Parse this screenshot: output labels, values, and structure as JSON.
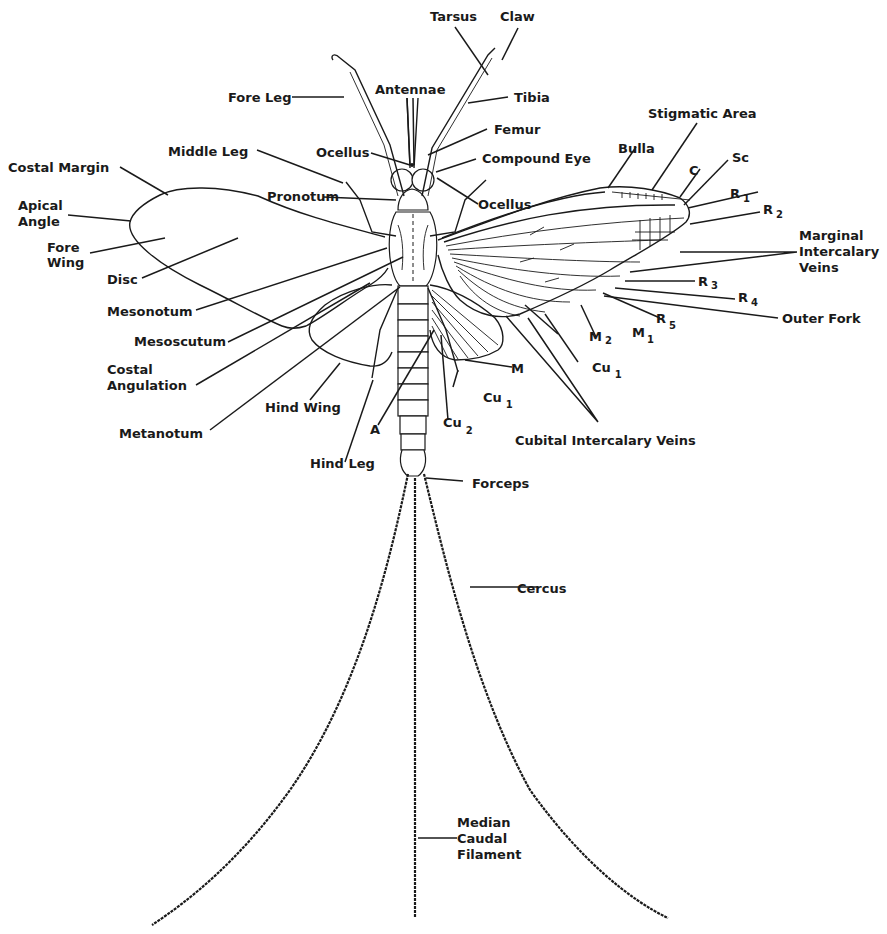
{
  "diagram": {
    "colors": {
      "ink": "#1a1a1a",
      "background": "#ffffff"
    },
    "labels": {
      "tarsus": "Tarsus",
      "claw": "Claw",
      "fore_leg": "Fore Leg",
      "antennae": "Antennae",
      "tibia": "Tibia",
      "stigmatic_area": "Stigmatic Area",
      "femur": "Femur",
      "middle_leg": "Middle Leg",
      "ocellus_left": "Ocellus",
      "compound_eye": "Compound Eye",
      "bulla": "Bulla",
      "c": "C",
      "sc": "Sc",
      "r1": "R",
      "r1_sub": "1",
      "r2": "R",
      "r2_sub": "2",
      "costal_margin": "Costal Margin",
      "apical_angle_1": "Apical",
      "apical_angle_2": "Angle",
      "pronotum": "Pronotum",
      "ocellus_right": "Ocellus",
      "fore_wing_1": "Fore",
      "fore_wing_2": "Wing",
      "disc": "Disc",
      "marginal_1": "Marginal",
      "marginal_2": "Intercalary",
      "marginal_3": "Veins",
      "r3": "R",
      "r3_sub": "3",
      "r4": "R",
      "r4_sub": "4",
      "mesonotum": "Mesonotum",
      "r5": "R",
      "r5_sub": "5",
      "outer_fork": "Outer Fork",
      "mesoscutum": "Mesoscutum",
      "m2": "M",
      "m2_sub": "2",
      "m1": "M",
      "m1_sub": "1",
      "costal_angulation_1": "Costal",
      "costal_angulation_2": "Angulation",
      "m": "M",
      "cu1_fore": "Cu",
      "cu1_fore_sub": "1",
      "hind_wing": "Hind Wing",
      "cu1_hind": "Cu",
      "cu1_hind_sub": "1",
      "metanotum": "Metanotum",
      "a": "A",
      "cu2": "Cu",
      "cu2_sub": "2",
      "cubital_intercalary": "Cubital Intercalary Veins",
      "hind_leg": "Hind Leg",
      "forceps": "Forceps",
      "cercus": "Cercus",
      "median_1": "Median",
      "median_2": "Caudal",
      "median_3": "Filament"
    }
  }
}
